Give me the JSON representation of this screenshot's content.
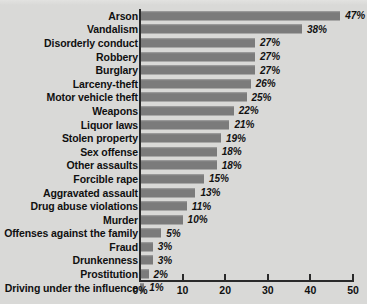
{
  "chart_data": {
    "type": "bar",
    "orientation": "horizontal",
    "title": "",
    "xlabel": "",
    "ylabel": "",
    "xlim": [
      0,
      50
    ],
    "grid": false,
    "legend": "none",
    "bar_color": "#7b7b7b",
    "background_color": "#d9d9d7",
    "axis_color": "#2a2a2a",
    "value_suffix": "%",
    "xticks": [
      {
        "value": 0,
        "label": "0%"
      },
      {
        "value": 10,
        "label": "10"
      },
      {
        "value": 20,
        "label": "20"
      },
      {
        "value": 30,
        "label": "30"
      },
      {
        "value": 40,
        "label": "40"
      },
      {
        "value": 50,
        "label": "50"
      }
    ],
    "categories": [
      "Arson",
      "Vandalism",
      "Disorderly conduct",
      "Robbery",
      "Burglary",
      "Larceny-theft",
      "Motor vehicle theft",
      "Weapons",
      "Liquor laws",
      "Stolen property",
      "Sex offense",
      "Other assaults",
      "Forcible rape",
      "Aggravated assault",
      "Drug abuse violations",
      "Murder",
      "Offenses against the family",
      "Fraud",
      "Drunkenness",
      "Prostitution",
      "Driving under the influence"
    ],
    "values": [
      47,
      38,
      27,
      27,
      27,
      26,
      25,
      22,
      21,
      19,
      18,
      18,
      15,
      13,
      11,
      10,
      5,
      3,
      3,
      2,
      1
    ],
    "value_labels": [
      "47%",
      "38%",
      "27%",
      "27%",
      "27%",
      "26%",
      "25%",
      "22%",
      "21%",
      "19%",
      "18%",
      "18%",
      "15%",
      "13%",
      "11%",
      "10%",
      "5%",
      "3%",
      "3%",
      "2%",
      "1%"
    ]
  }
}
